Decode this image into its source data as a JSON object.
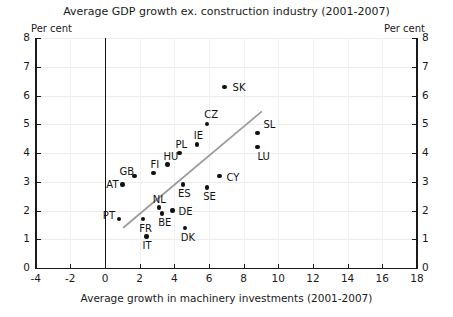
{
  "chart_data": {
    "type": "scatter",
    "title": "Average GDP growth ex. construction industry (2001-2007)",
    "xlabel": "Average growth in machinery investments (2001-2007)",
    "ylabel": "Per cent",
    "ylabel_right": "Per cent",
    "xlim": [
      -4,
      18
    ],
    "ylim": [
      0,
      8
    ],
    "xticks": [
      -4,
      -2,
      0,
      2,
      4,
      6,
      8,
      10,
      12,
      14,
      16,
      18
    ],
    "yticks": [
      0,
      1,
      2,
      3,
      4,
      5,
      6,
      7,
      8
    ],
    "grid": true,
    "legend": "none",
    "points": [
      {
        "label": "SK",
        "x": 6.9,
        "y": 6.3,
        "lx": 8,
        "ly": -4
      },
      {
        "label": "CZ",
        "x": 5.9,
        "y": 5.0,
        "lx": -3,
        "ly": -14
      },
      {
        "label": "SL",
        "x": 8.8,
        "y": 4.7,
        "lx": 6,
        "ly": -13
      },
      {
        "label": "IE",
        "x": 5.3,
        "y": 4.3,
        "lx": -3,
        "ly": -13
      },
      {
        "label": "LU",
        "x": 8.8,
        "y": 4.2,
        "lx": 0,
        "ly": 5
      },
      {
        "label": "PL",
        "x": 4.3,
        "y": 4.0,
        "lx": -4,
        "ly": -13
      },
      {
        "label": "HU",
        "x": 3.6,
        "y": 3.6,
        "lx": -4,
        "ly": -13
      },
      {
        "label": "FI",
        "x": 2.8,
        "y": 3.3,
        "lx": -3,
        "ly": -13
      },
      {
        "label": "GB",
        "x": 1.7,
        "y": 3.2,
        "lx": -15,
        "ly": -9
      },
      {
        "label": "CY",
        "x": 6.6,
        "y": 3.2,
        "lx": 7,
        "ly": -3
      },
      {
        "label": "ES",
        "x": 4.5,
        "y": 2.9,
        "lx": -5,
        "ly": 4
      },
      {
        "label": "SE",
        "x": 5.9,
        "y": 2.8,
        "lx": -4,
        "ly": 4
      },
      {
        "label": "AT",
        "x": 1.0,
        "y": 2.9,
        "lx": -16,
        "ly": -5
      },
      {
        "label": "NL",
        "x": 3.1,
        "y": 2.1,
        "lx": -6,
        "ly": -13
      },
      {
        "label": "DE",
        "x": 3.9,
        "y": 2.0,
        "lx": 6,
        "ly": -4
      },
      {
        "label": "BE",
        "x": 3.3,
        "y": 1.9,
        "lx": -4,
        "ly": 5
      },
      {
        "label": "PT",
        "x": 0.8,
        "y": 1.7,
        "lx": -16,
        "ly": -8
      },
      {
        "label": "FR",
        "x": 2.2,
        "y": 1.7,
        "lx": -4,
        "ly": 5
      },
      {
        "label": "DK",
        "x": 4.6,
        "y": 1.4,
        "lx": -4,
        "ly": 5
      },
      {
        "label": "IT",
        "x": 2.4,
        "y": 1.1,
        "lx": -4,
        "ly": 5
      }
    ],
    "trendline": {
      "x0": 1.05,
      "y0": 1.4,
      "x1": 9.05,
      "y1": 5.45
    }
  }
}
